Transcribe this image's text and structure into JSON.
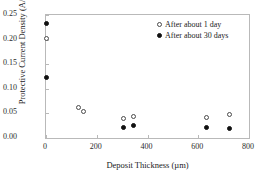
{
  "chart_data": {
    "type": "scatter",
    "title": "",
    "xlabel": "Deposit Thickness (µm)",
    "ylabel": "Protective Current Density (A/m²)",
    "xlim": [
      0,
      800
    ],
    "ylim": [
      0.0,
      0.25
    ],
    "xticks": [
      0,
      200,
      400,
      600,
      800
    ],
    "xtick_labels": [
      "0",
      "200",
      "400",
      "600",
      "800"
    ],
    "yticks": [
      0.0,
      0.05,
      0.1,
      0.15,
      0.2,
      0.25
    ],
    "ytick_labels": [
      "0.00",
      "0.05",
      "0.10",
      "0.15",
      "0.20",
      "0.25"
    ],
    "grid": false,
    "legend_position": "top-right",
    "series": [
      {
        "name": "After about 1 day",
        "marker": "open-circle",
        "color": "#4a4a4a",
        "points": [
          {
            "x": 0,
            "y": 0.203
          },
          {
            "x": 130,
            "y": 0.062
          },
          {
            "x": 148,
            "y": 0.054
          },
          {
            "x": 305,
            "y": 0.04
          },
          {
            "x": 345,
            "y": 0.043
          },
          {
            "x": 632,
            "y": 0.041
          },
          {
            "x": 722,
            "y": 0.048
          }
        ]
      },
      {
        "name": "After about 30 days",
        "marker": "filled-circle",
        "color": "#111111",
        "points": [
          {
            "x": 0,
            "y": 0.232
          },
          {
            "x": 0,
            "y": 0.122
          },
          {
            "x": 305,
            "y": 0.022
          },
          {
            "x": 345,
            "y": 0.026
          },
          {
            "x": 632,
            "y": 0.022
          },
          {
            "x": 722,
            "y": 0.02
          }
        ]
      }
    ]
  },
  "legend": {
    "entries": [
      {
        "label": "After about 1 day",
        "marker": "open-circle"
      },
      {
        "label": "After about 30 days",
        "marker": "filled-circle"
      }
    ]
  }
}
